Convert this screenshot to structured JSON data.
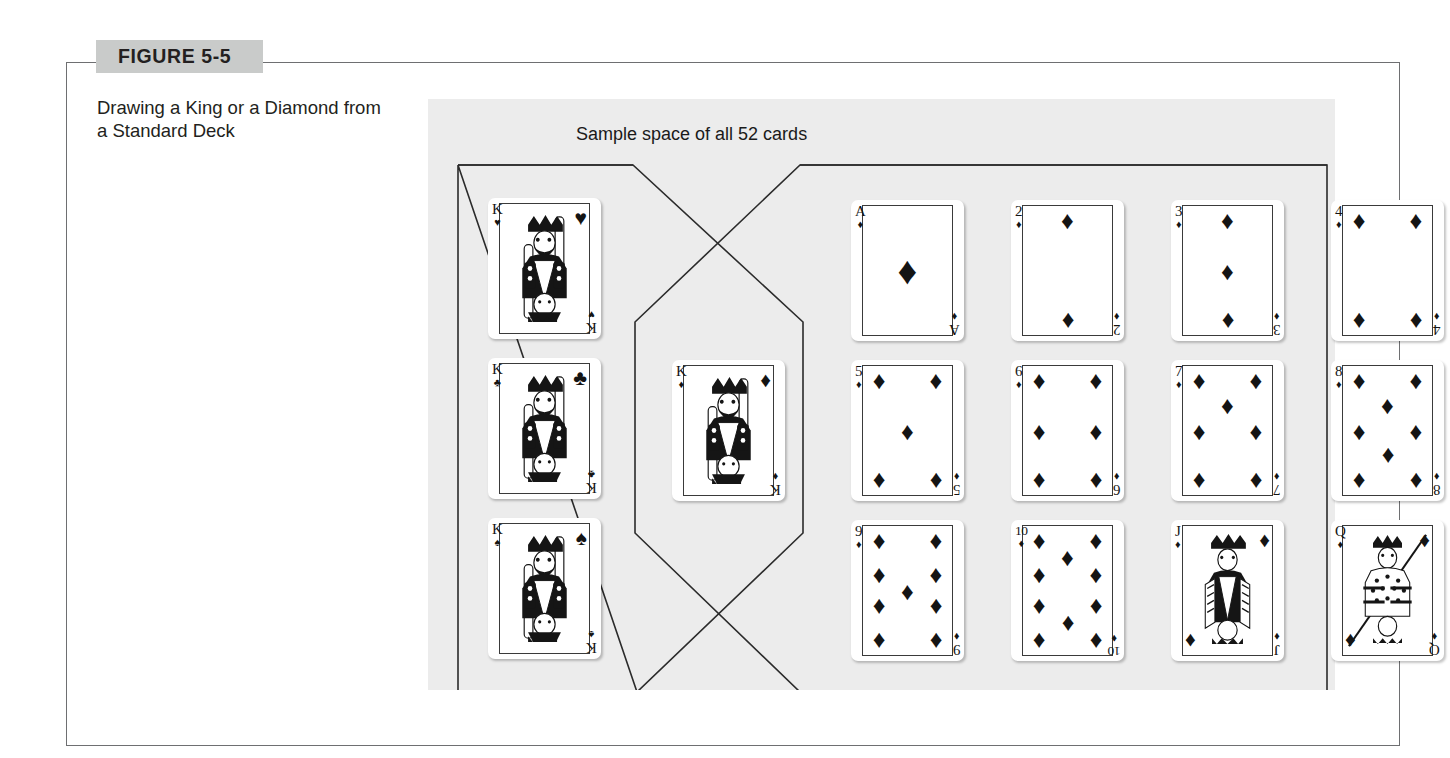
{
  "figure": {
    "badge_label": "FIGURE 5-5",
    "caption": "Drawing a King or a Diamond from a Standard Deck"
  },
  "diagram": {
    "sample_space_label": "Sample space of all 52 cards",
    "set_left_name": "Kings",
    "set_right_name": "Diamonds",
    "intersection_name": "King of Diamonds"
  },
  "suits": {
    "heart": "♥",
    "club": "♣",
    "spade": "♠",
    "diamond": "♦"
  },
  "cards": {
    "kings_only": [
      {
        "rank": "K",
        "suit": "heart",
        "suit_glyph": "♥",
        "name": "king-of-hearts"
      },
      {
        "rank": "K",
        "suit": "club",
        "suit_glyph": "♣",
        "name": "king-of-clubs"
      },
      {
        "rank": "K",
        "suit": "spade",
        "suit_glyph": "♠",
        "name": "king-of-spades"
      }
    ],
    "intersection": [
      {
        "rank": "K",
        "suit": "diamond",
        "suit_glyph": "♦",
        "name": "king-of-diamonds"
      }
    ],
    "diamonds_only": [
      {
        "rank": "A",
        "suit": "diamond",
        "suit_glyph": "♦",
        "name": "ace-of-diamonds"
      },
      {
        "rank": "2",
        "suit": "diamond",
        "suit_glyph": "♦",
        "name": "two-of-diamonds"
      },
      {
        "rank": "3",
        "suit": "diamond",
        "suit_glyph": "♦",
        "name": "three-of-diamonds"
      },
      {
        "rank": "4",
        "suit": "diamond",
        "suit_glyph": "♦",
        "name": "four-of-diamonds"
      },
      {
        "rank": "5",
        "suit": "diamond",
        "suit_glyph": "♦",
        "name": "five-of-diamonds"
      },
      {
        "rank": "6",
        "suit": "diamond",
        "suit_glyph": "♦",
        "name": "six-of-diamonds"
      },
      {
        "rank": "7",
        "suit": "diamond",
        "suit_glyph": "♦",
        "name": "seven-of-diamonds"
      },
      {
        "rank": "8",
        "suit": "diamond",
        "suit_glyph": "♦",
        "name": "eight-of-diamonds"
      },
      {
        "rank": "9",
        "suit": "diamond",
        "suit_glyph": "♦",
        "name": "nine-of-diamonds"
      },
      {
        "rank": "10",
        "suit": "diamond",
        "suit_glyph": "♦",
        "name": "ten-of-diamonds"
      },
      {
        "rank": "J",
        "suit": "diamond",
        "suit_glyph": "♦",
        "name": "jack-of-diamonds"
      },
      {
        "rank": "Q",
        "suit": "diamond",
        "suit_glyph": "♦",
        "name": "queen-of-diamonds"
      }
    ]
  },
  "colors": {
    "badge_background": "#c9cbca",
    "frame_border": "#6e6f71",
    "panel_background": "#ececec",
    "ink": "#141414",
    "card_face": "#ffffff"
  }
}
